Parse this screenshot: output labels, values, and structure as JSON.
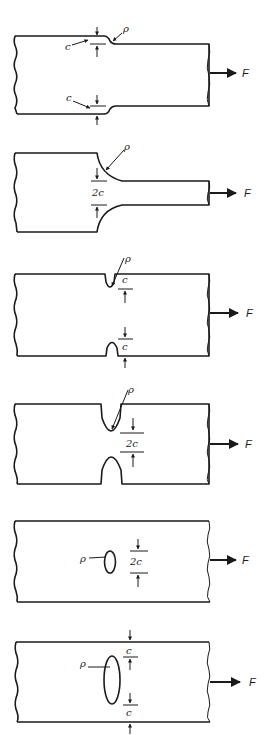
{
  "figure": {
    "panels": [
      {
        "id": 1,
        "name": "shallow-step-shoulder",
        "labels": {
          "rho": "ρ",
          "c_top": "c",
          "c_bottom": "c",
          "force": "F"
        }
      },
      {
        "id": 2,
        "name": "filleted-shoulder",
        "labels": {
          "rho": "ρ",
          "width": "2c",
          "force": "F"
        }
      },
      {
        "id": 3,
        "name": "shallow-double-notch",
        "labels": {
          "rho": "ρ",
          "c_top": "c",
          "c_bottom": "c",
          "force": "F"
        }
      },
      {
        "id": 4,
        "name": "deep-double-notch",
        "labels": {
          "rho": "ρ",
          "width": "2c",
          "force": "F"
        }
      },
      {
        "id": 5,
        "name": "small-elliptical-hole",
        "labels": {
          "rho": "ρ",
          "width": "2c",
          "force": "F"
        }
      },
      {
        "id": 6,
        "name": "large-elliptical-hole",
        "labels": {
          "rho": "ρ",
          "c_top": "c",
          "c_bottom": "c",
          "force": "F"
        }
      }
    ]
  }
}
